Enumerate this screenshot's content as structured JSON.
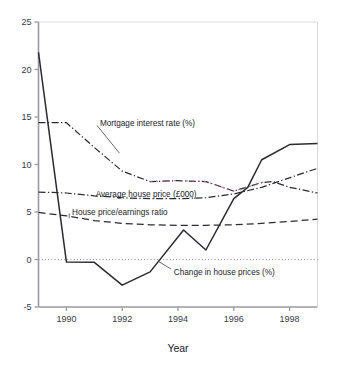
{
  "chart_data": {
    "type": "line",
    "title": "",
    "xlabel": "Year",
    "ylabel": "",
    "xlim": [
      1989,
      1999
    ],
    "ylim": [
      -5,
      25
    ],
    "xticks": [
      1990,
      1992,
      1994,
      1996,
      1998
    ],
    "xtick_labels": [
      "1990",
      "1992",
      "1994",
      "1996",
      "1998"
    ],
    "yticks": [
      -5,
      0,
      5,
      10,
      15,
      20,
      25
    ],
    "ytick_labels": [
      "-5",
      "0",
      "5",
      "10",
      "15",
      "20",
      "25"
    ],
    "grid": false,
    "zero_line": true,
    "legend_position": "inline-annotations",
    "series": [
      {
        "name": "Change in house prices (%)",
        "style": "solid",
        "color": "#2b2b33",
        "label_x": 1993.85,
        "label_y": -1.25,
        "x": [
          1989,
          1990,
          1991,
          1992,
          1993,
          1994.2,
          1995,
          1996,
          1996.5,
          1997,
          1998,
          1999
        ],
        "y": [
          21.8,
          -0.25,
          -0.3,
          -2.7,
          -1.3,
          3.1,
          1.0,
          6.4,
          7.6,
          10.5,
          12.1,
          12.2
        ]
      },
      {
        "name": "Mortgage interest rate (%)",
        "style": "dash-dot",
        "color": "#2b2b33",
        "label_x": 1991.2,
        "label_y": 14.35,
        "x": [
          1989,
          1990,
          1991,
          1992,
          1993,
          1994,
          1995,
          1996,
          1997,
          1997.4,
          1998,
          1999
        ],
        "y": [
          14.4,
          14.4,
          11.8,
          9.3,
          8.2,
          8.3,
          8.2,
          7.2,
          8.1,
          8.2,
          7.6,
          7.0
        ]
      },
      {
        "name": "Average house price (£000)",
        "style": "dash-dot",
        "color": "#2b2b33",
        "label_x": 1991.05,
        "label_y": 6.95,
        "x": [
          1989,
          1990,
          1991,
          1992,
          1993,
          1994,
          1995,
          1996,
          1997,
          1998,
          1999
        ],
        "y": [
          7.1,
          7.0,
          6.7,
          6.5,
          6.4,
          6.4,
          6.5,
          6.9,
          7.6,
          8.6,
          9.6
        ]
      },
      {
        "name": "House price/earnings ratio",
        "style": "dashed",
        "color": "#2b2b33",
        "label_x": 1990.2,
        "label_y": 5.05,
        "x": [
          1989,
          1990,
          1991,
          1992,
          1993,
          1994,
          1995,
          1996,
          1997,
          1998,
          1999
        ],
        "y": [
          4.95,
          4.6,
          4.1,
          3.8,
          3.65,
          3.6,
          3.6,
          3.65,
          3.8,
          4.0,
          4.25
        ]
      }
    ]
  },
  "colors": {
    "axis": "#9a9aa2",
    "text": "#23232e",
    "tick_text": "#3a3a4a",
    "line": "#2b2b33",
    "accent_red": "#c85a78",
    "background": "#ffffff"
  }
}
